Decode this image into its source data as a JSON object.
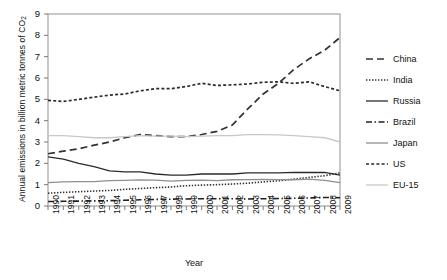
{
  "chart_data": {
    "type": "line",
    "title": "",
    "xlabel": "Year",
    "ylabel": "Annual emissions in billion metric tonnes of CO",
    "ylabel_sub": "2",
    "xlim": [
      1990,
      2009
    ],
    "ylim": [
      0,
      9
    ],
    "yticks": [
      0,
      1,
      2,
      3,
      4,
      5,
      6,
      7,
      8,
      9
    ],
    "grid": false,
    "legend_position": "right",
    "x": [
      1990,
      1991,
      1992,
      1993,
      1994,
      1995,
      1996,
      1997,
      1998,
      1999,
      2000,
      2001,
      2002,
      2003,
      2004,
      2005,
      2006,
      2007,
      2008,
      2009
    ],
    "categories": [
      "1990",
      "1991",
      "1992",
      "1993",
      "1994",
      "1995",
      "1996",
      "1997",
      "1998",
      "1999",
      "2000",
      "2001",
      "2002",
      "2003",
      "2004",
      "2005",
      "2006",
      "2007",
      "2008",
      "2009"
    ],
    "series": [
      {
        "name": "China",
        "style": "dashed",
        "color": "#333333",
        "values": [
          2.45,
          2.57,
          2.68,
          2.85,
          3.0,
          3.2,
          3.35,
          3.3,
          3.25,
          3.25,
          3.35,
          3.5,
          3.8,
          4.55,
          5.25,
          5.75,
          6.4,
          6.9,
          7.3,
          7.9
        ]
      },
      {
        "name": "India",
        "style": "dotted",
        "color": "#333333",
        "values": [
          0.6,
          0.64,
          0.67,
          0.7,
          0.73,
          0.78,
          0.82,
          0.86,
          0.89,
          0.95,
          0.98,
          1.0,
          1.03,
          1.07,
          1.13,
          1.18,
          1.26,
          1.34,
          1.42,
          1.55
        ]
      },
      {
        "name": "Russia",
        "style": "solid",
        "color": "#2b2b2b",
        "values": [
          2.3,
          2.2,
          2.0,
          1.85,
          1.65,
          1.6,
          1.6,
          1.5,
          1.45,
          1.45,
          1.5,
          1.5,
          1.5,
          1.55,
          1.55,
          1.55,
          1.58,
          1.57,
          1.58,
          1.45
        ]
      },
      {
        "name": "Brazil",
        "style": "dashdot",
        "color": "#222222",
        "values": [
          0.21,
          0.22,
          0.23,
          0.24,
          0.25,
          0.27,
          0.29,
          0.31,
          0.32,
          0.33,
          0.34,
          0.34,
          0.34,
          0.33,
          0.34,
          0.35,
          0.36,
          0.38,
          0.4,
          0.39
        ]
      },
      {
        "name": "Japan",
        "style": "solid",
        "color": "#8f8f8f",
        "values": [
          1.1,
          1.13,
          1.14,
          1.14,
          1.19,
          1.2,
          1.22,
          1.21,
          1.17,
          1.2,
          1.21,
          1.19,
          1.23,
          1.24,
          1.25,
          1.24,
          1.23,
          1.26,
          1.2,
          1.1
        ]
      },
      {
        "name": "US",
        "style": "shortdash",
        "color": "#2b2b2b",
        "values": [
          4.95,
          4.9,
          5.0,
          5.1,
          5.2,
          5.25,
          5.4,
          5.5,
          5.5,
          5.6,
          5.75,
          5.65,
          5.68,
          5.72,
          5.8,
          5.82,
          5.75,
          5.82,
          5.6,
          5.4
        ]
      },
      {
        "name": "EU-15",
        "style": "solid",
        "color": "#c8c8c8",
        "values": [
          3.3,
          3.3,
          3.25,
          3.2,
          3.2,
          3.25,
          3.3,
          3.28,
          3.28,
          3.25,
          3.28,
          3.3,
          3.3,
          3.35,
          3.35,
          3.33,
          3.3,
          3.25,
          3.2,
          3.0
        ]
      }
    ]
  },
  "legend": {
    "items": [
      {
        "label": "China"
      },
      {
        "label": "India"
      },
      {
        "label": "Russia"
      },
      {
        "label": "Brazil"
      },
      {
        "label": "Japan"
      },
      {
        "label": "US"
      },
      {
        "label": "EU-15"
      }
    ]
  }
}
